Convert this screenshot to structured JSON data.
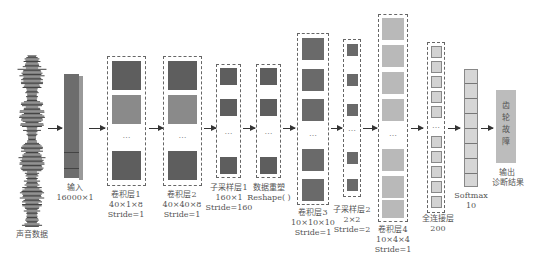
{
  "colors": {
    "dark_block": "#5e5e5e",
    "mid_block": "#8a8a8a",
    "light_block": "#b9b9b9",
    "output_block": "#bcbcbc",
    "dashed_border": "#666666"
  },
  "nodes": [
    {
      "id": "audio",
      "label": "声音数据"
    },
    {
      "id": "input",
      "label": "输入",
      "dims": "16000×1"
    },
    {
      "id": "conv1",
      "label": "卷积层1",
      "dims": "40×1×8",
      "stride": "Stride=1"
    },
    {
      "id": "conv2",
      "label": "卷积层2",
      "dims": "40×40×8",
      "stride": "Stride=1"
    },
    {
      "id": "pool1",
      "label": "子采样层1",
      "dims": "160×1",
      "stride": "Stride=160"
    },
    {
      "id": "reshape",
      "label": "数据重塑",
      "dims": "Reshape( )"
    },
    {
      "id": "conv3",
      "label": "卷积层3",
      "dims": "10×10×10",
      "stride": "Stride=1"
    },
    {
      "id": "pool2",
      "label": "子采样层2",
      "dims": "2×2",
      "stride": "Stride=2"
    },
    {
      "id": "conv4",
      "label": "卷积层4",
      "dims": "10×4×4",
      "stride": "Stride=1"
    },
    {
      "id": "fc",
      "label": "全连接层",
      "dims": "200"
    },
    {
      "id": "softmax",
      "label": "Softmax",
      "dims": "10"
    },
    {
      "id": "output",
      "label": "输出",
      "dims": "诊断结果",
      "content": "齿轮故障"
    }
  ],
  "ellipsis": "…"
}
